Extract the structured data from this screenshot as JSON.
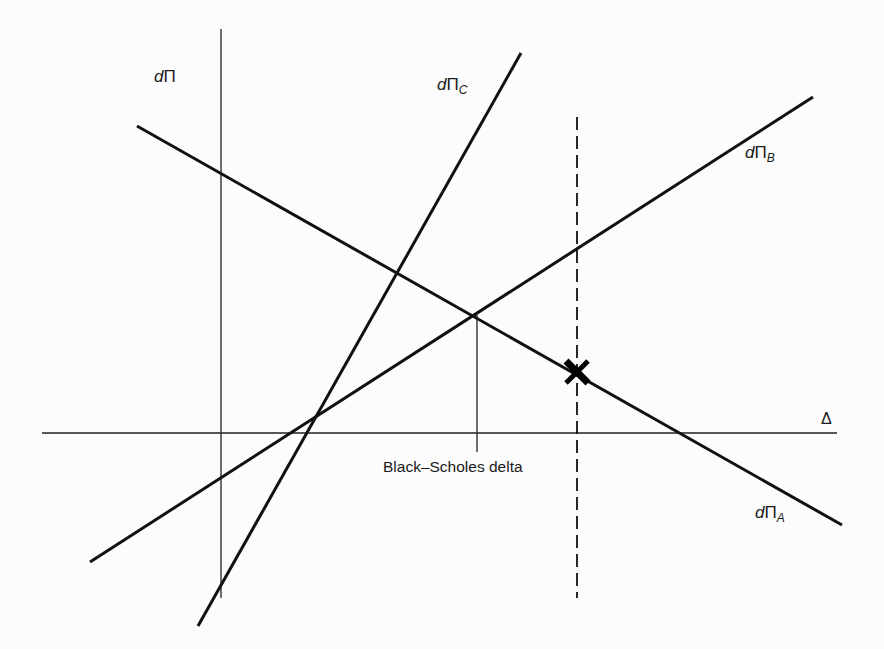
{
  "diagram": {
    "title": "",
    "axes": {
      "y_label": {
        "prefix": "d",
        "symbol": "Π",
        "sub": ""
      },
      "x_label": "Δ"
    },
    "lines": [
      {
        "id": "A",
        "label_prefix": "d",
        "label_symbol": "Π",
        "label_sub": "A",
        "style": "solid-thick",
        "direction": "decreasing"
      },
      {
        "id": "B",
        "label_prefix": "d",
        "label_symbol": "Π",
        "label_sub": "B",
        "style": "solid-thick",
        "direction": "increasing"
      },
      {
        "id": "C",
        "label_prefix": "d",
        "label_symbol": "Π",
        "label_sub": "C",
        "style": "solid-thick",
        "direction": "increasing-steep"
      }
    ],
    "annotations": {
      "bs_delta_label": "Black–Scholes delta",
      "marker": "X",
      "dashed_line": "vertical dashed line through marker"
    },
    "colors": {
      "ink": "#111111",
      "background": "#fcfcfc"
    }
  }
}
